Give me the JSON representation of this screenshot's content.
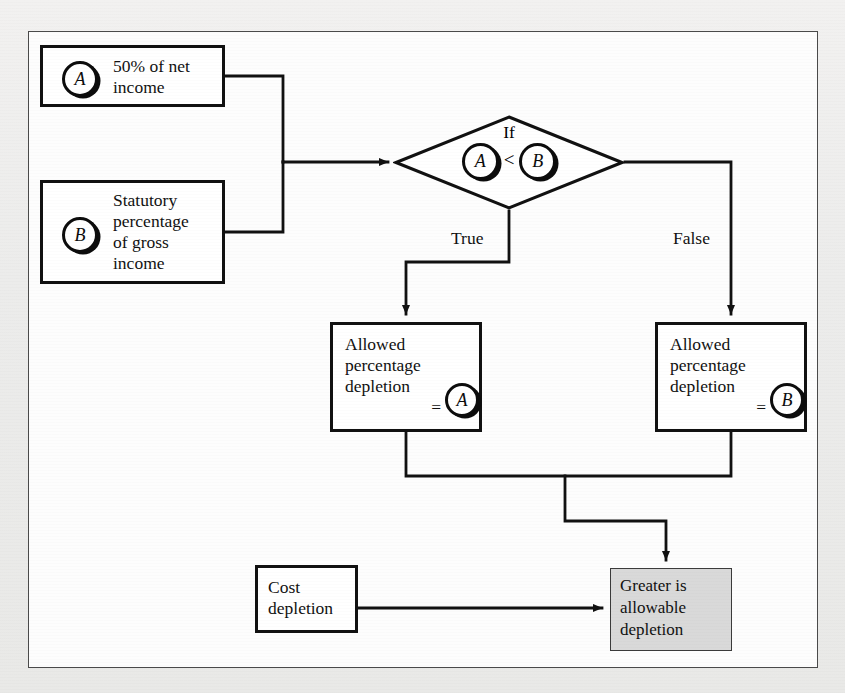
{
  "diagram": {
    "background_color": "#ecebea",
    "frame_color": "#4a4a4a",
    "node_border_color": "#111111",
    "result_fill_color": "#d9d9d9"
  },
  "nodes": {
    "box_a": {
      "badge": "A",
      "line1": "50% of net",
      "line2": "income"
    },
    "box_b": {
      "badge": "B",
      "line1": "Statutory",
      "line2": "percentage",
      "line3": "of gross",
      "line4": "income"
    },
    "decision": {
      "keyword": "If",
      "left_badge": "A",
      "operator": "<",
      "right_badge": "B"
    },
    "allowed_true": {
      "line1": "Allowed",
      "line2": "percentage",
      "line3": "depletion",
      "equals": "=",
      "badge": "A"
    },
    "allowed_false": {
      "line1": "Allowed",
      "line2": "percentage",
      "line3": "depletion",
      "equals": "=",
      "badge": "B"
    },
    "cost_depletion": {
      "line1": "Cost",
      "line2": "depletion"
    },
    "result": {
      "line1": "Greater is",
      "line2": "allowable",
      "line3": "depletion"
    }
  },
  "edges": {
    "true_label": "True",
    "false_label": "False"
  }
}
